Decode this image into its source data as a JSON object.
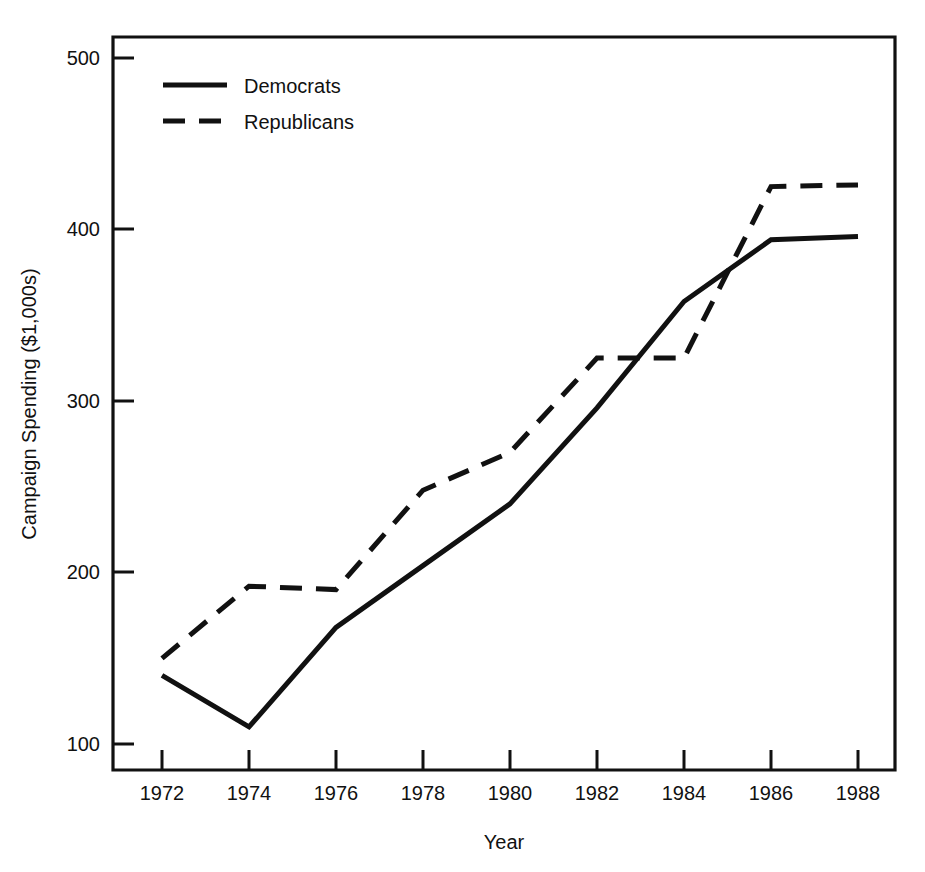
{
  "chart_data": {
    "type": "line",
    "title": "",
    "xlabel": "Year",
    "ylabel": "Campaign Spending ($1,000s)",
    "x": [
      1972,
      1974,
      1976,
      1978,
      1980,
      1982,
      1984,
      1986,
      1988
    ],
    "xtick_labels": [
      "1972",
      "1974",
      "1976",
      "1978",
      "1980",
      "1982",
      "1984",
      "1986",
      "1988"
    ],
    "ytick_labels": [
      "100",
      "200",
      "300",
      "400",
      "500"
    ],
    "yticks": [
      100,
      200,
      300,
      400,
      500
    ],
    "xlim": [
      1971,
      1989
    ],
    "ylim": [
      60,
      530
    ],
    "grid": false,
    "legend_position": "top-left",
    "series": [
      {
        "name": "Democrats",
        "style": "solid",
        "color": "#111111",
        "values": [
          140,
          110,
          168,
          204,
          240,
          296,
          358,
          394,
          396
        ]
      },
      {
        "name": "Republicans",
        "style": "dashed",
        "color": "#111111",
        "values": [
          150,
          192,
          190,
          248,
          270,
          325,
          325,
          425,
          426
        ]
      }
    ]
  },
  "legend": {
    "items": [
      {
        "label": "Democrats",
        "style": "solid"
      },
      {
        "label": "Republicans",
        "style": "dashed"
      }
    ]
  },
  "axes": {
    "x_title": "Year",
    "y_title": "Campaign Spending ($1,000s)"
  }
}
